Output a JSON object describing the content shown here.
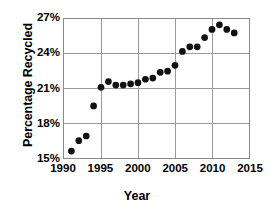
{
  "chart_data": {
    "type": "scatter",
    "title": "",
    "xlabel": "Year",
    "ylabel": "Percentage Recycled",
    "xlim": [
      1990,
      2015
    ],
    "ylim": [
      15,
      27
    ],
    "grid": true,
    "legend": "none",
    "x_ticks": [
      "1990",
      "1995",
      "2000",
      "2005",
      "2010",
      "2015"
    ],
    "x_tick_values": [
      1990,
      1995,
      2000,
      2005,
      2010,
      2015
    ],
    "y_ticks": [
      "15%",
      "18%",
      "21%",
      "24%",
      "27%"
    ],
    "y_tick_values": [
      15,
      18,
      21,
      24,
      27
    ],
    "x": [
      1991,
      1992,
      1993,
      1994,
      1995,
      1996,
      1997,
      1998,
      1999,
      2000,
      2001,
      2002,
      2003,
      2004,
      2005,
      2006,
      2007,
      2008,
      2009,
      2010,
      2011,
      2012,
      2013
    ],
    "values": [
      15.6,
      16.5,
      16.9,
      19.5,
      21.1,
      21.6,
      21.3,
      21.3,
      21.4,
      21.5,
      21.8,
      21.9,
      22.4,
      22.5,
      23.0,
      24.2,
      24.6,
      24.6,
      25.4,
      26.1,
      26.5,
      26.1,
      25.8
    ],
    "marker": "filled-circle",
    "marker_color": "#111111",
    "marker_radius_px": 3.4,
    "gridline_color": "#9a9a9a",
    "frame_color": "#8a8a8a",
    "background": "#ffffff"
  }
}
